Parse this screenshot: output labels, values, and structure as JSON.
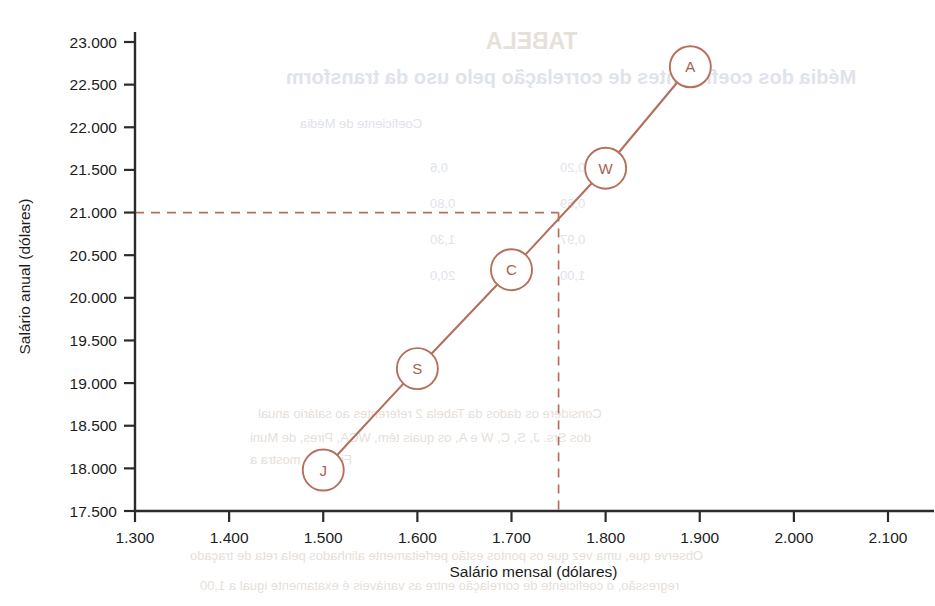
{
  "chart_data": {
    "type": "line",
    "title": "",
    "xlabel": "Salário mensal (dólares)",
    "ylabel": "Salário anual (dólares)",
    "xlim": [
      1300,
      2100
    ],
    "ylim": [
      17500,
      23000
    ],
    "xticks": [
      1300,
      1400,
      1500,
      1600,
      1700,
      1800,
      1900,
      2000,
      2100
    ],
    "xtick_labels": [
      "1.300",
      "1.400",
      "1.500",
      "1.600",
      "1.700",
      "1.800",
      "1.900",
      "2.000",
      "2.100"
    ],
    "yticks": [
      17500,
      18000,
      18500,
      19000,
      19500,
      20000,
      20500,
      21000,
      21500,
      22000,
      22500,
      23000
    ],
    "ytick_labels": [
      "17.500",
      "18.000",
      "18.500",
      "19.000",
      "19.500",
      "20.000",
      "20.500",
      "21.000",
      "21.500",
      "22.000",
      "22.500",
      "23.000"
    ],
    "grid": false,
    "legend": "none",
    "series_color": "#b5705c",
    "points": [
      {
        "label": "J",
        "x": 1500,
        "y": 17980
      },
      {
        "label": "S",
        "x": 1600,
        "y": 19170
      },
      {
        "label": "C",
        "x": 1700,
        "y": 20330
      },
      {
        "label": "W",
        "x": 1800,
        "y": 21520
      },
      {
        "label": "A",
        "x": 1890,
        "y": 22710
      }
    ],
    "reference_lines": [
      {
        "orientation": "horizontal",
        "value": 21000,
        "style": "dashed",
        "color": "#b5705c"
      },
      {
        "orientation": "vertical",
        "value": 1750,
        "style": "dashed",
        "color": "#b5705c"
      }
    ]
  },
  "axes": {
    "x_title": "Salário mensal (dólares)",
    "y_title": "Salário anual (dólares)"
  },
  "ghost_text": {
    "note": "faint mirrored show-through from reverse of scanned page",
    "lines": [
      {
        "text": "TABELA",
        "x": 486,
        "y": 28,
        "size": 23,
        "weight": "700",
        "tone": "sepia"
      },
      {
        "text": "Média dos coeficientes de correlação pelo uso da transform",
        "x": 286,
        "y": 66,
        "size": 20,
        "weight": "700",
        "tone": "blue"
      },
      {
        "text": "Coeficiente de Média",
        "x": 300,
        "y": 116,
        "size": 13,
        "weight": "400",
        "tone": "blue"
      },
      {
        "text": "0,6",
        "x": 430,
        "y": 160,
        "size": 13,
        "weight": "400",
        "tone": "blue"
      },
      {
        "text": "0,20",
        "x": 560,
        "y": 160,
        "size": 13,
        "weight": "400",
        "tone": "blue"
      },
      {
        "text": "0,80",
        "x": 430,
        "y": 196,
        "size": 13,
        "weight": "400",
        "tone": "blue"
      },
      {
        "text": "0,69",
        "x": 560,
        "y": 196,
        "size": 13,
        "weight": "400",
        "tone": "blue"
      },
      {
        "text": "1,30",
        "x": 430,
        "y": 232,
        "size": 13,
        "weight": "400",
        "tone": "blue"
      },
      {
        "text": "0,97",
        "x": 560,
        "y": 232,
        "size": 13,
        "weight": "400",
        "tone": "blue"
      },
      {
        "text": "20,0",
        "x": 430,
        "y": 268,
        "size": 13,
        "weight": "400",
        "tone": "blue"
      },
      {
        "text": "1,00",
        "x": 560,
        "y": 268,
        "size": 13,
        "weight": "400",
        "tone": "blue"
      },
      {
        "text": "Considere os dados da Tabela 2 referentes ao salário anual",
        "x": 258,
        "y": 406,
        "size": 13,
        "weight": "400",
        "tone": "sepia"
      },
      {
        "text": "dos Srs. J, S, C, W e A, os quais têm, WCA, Pires, de Muni",
        "x": 250,
        "y": 430,
        "size": 13,
        "weight": "400",
        "tone": "sepia"
      },
      {
        "text": "Figura 1 mostra a",
        "x": 250,
        "y": 452,
        "size": 13,
        "weight": "400",
        "tone": "sepia"
      },
      {
        "text": "Observe que, uma vez que os pontos estão perfeitamente alinhados pela reta de traçado",
        "x": 190,
        "y": 548,
        "size": 13,
        "weight": "400",
        "tone": "sepia"
      },
      {
        "text": "regressão, o coeficiente de correlação entre as variáveis é exatamente igual a 1,00",
        "x": 200,
        "y": 578,
        "size": 13,
        "weight": "400",
        "tone": "sepia"
      }
    ]
  }
}
